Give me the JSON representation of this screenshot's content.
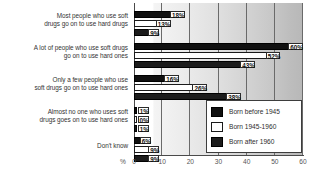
{
  "chart_data": {
    "type": "bar",
    "orientation": "horizontal",
    "title": "",
    "xlabel": "%",
    "ylabel": "",
    "xlim": [
      0,
      60
    ],
    "xticks": [
      0,
      10,
      20,
      30,
      40,
      50,
      60
    ],
    "grid": true,
    "legend_position": "inside-bottom-right",
    "categories": [
      "Most people who use soft drugs go on to use hard drugs",
      "A lot of people who use soft drugs go on to use hard ones",
      "Only a few people who use soft drugs go on to use hard ones",
      "Almost no one who uses soft drugs goes on to use hard ones",
      "Don't know"
    ],
    "category_lines": [
      [
        "Most people who use soft",
        "drugs go on to use hard drugs"
      ],
      [
        "A lot of people who use soft drugs",
        "go on to use hard ones"
      ],
      [
        "Only a few people who use",
        "soft drugs go on to use hard ones"
      ],
      [
        "Almost no one who uses soft",
        "drugs goes on to use hard ones"
      ],
      [
        "Don't know"
      ]
    ],
    "series": [
      {
        "name": "Born before 1945",
        "color": "#101010",
        "values": [
          18,
          60,
          16,
          1,
          6
        ],
        "labels": [
          "18%",
          "60%",
          "16%",
          "1%",
          "6%"
        ]
      },
      {
        "name": "Born 1945-1960",
        "color": "#ffffff",
        "values": [
          13,
          52,
          26,
          0,
          9
        ],
        "labels": [
          "13%",
          "52%",
          "26%",
          "0%",
          "9%"
        ]
      },
      {
        "name": "Born after 1960",
        "color": "#1c1c1c",
        "values": [
          9,
          43,
          38,
          1,
          9
        ],
        "labels": [
          "9%",
          "43%",
          "38%",
          "1%",
          "9%"
        ]
      }
    ]
  },
  "axis": {
    "unit": "%",
    "ticks": [
      "0",
      "10",
      "20",
      "30",
      "40",
      "50",
      "60"
    ]
  },
  "legend": {
    "items": [
      {
        "label": "Born before 1945"
      },
      {
        "label": "Born 1945-1960"
      },
      {
        "label": "Born after 1960"
      }
    ]
  }
}
